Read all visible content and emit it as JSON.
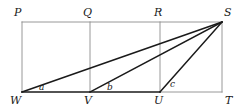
{
  "figure": {
    "kind": "geometry-diagram",
    "canvas": {
      "width": 250,
      "height": 111
    },
    "colors": {
      "stroke_thin": "#8c8c8c",
      "stroke_thick": "#1a1a1a",
      "label": "#1a1a1a",
      "background": "#ffffff"
    },
    "stroke_widths": {
      "thin": 0.9,
      "thick": 1.5
    },
    "points": {
      "P": {
        "x": 22,
        "y": 22
      },
      "Q": {
        "x": 90,
        "y": 22
      },
      "R": {
        "x": 160,
        "y": 22
      },
      "S": {
        "x": 222,
        "y": 22
      },
      "W": {
        "x": 22,
        "y": 92
      },
      "V": {
        "x": 90,
        "y": 92
      },
      "U": {
        "x": 160,
        "y": 92
      },
      "T": {
        "x": 222,
        "y": 92
      }
    },
    "thin_segments": [
      {
        "name": "top-edge-PS",
        "from": "P",
        "to": "S"
      },
      {
        "name": "left-edge-PW",
        "from": "P",
        "to": "W"
      },
      {
        "name": "right-edge-ST",
        "from": "S",
        "to": "T"
      },
      {
        "name": "bottom-edge-UT",
        "from": "U",
        "to": "T"
      },
      {
        "name": "divider-QV",
        "from": "Q",
        "to": "V"
      },
      {
        "name": "divider-RU",
        "from": "R",
        "to": "U"
      }
    ],
    "thick_segments": [
      {
        "name": "base-WU",
        "from": "W",
        "to": "U"
      },
      {
        "name": "cevian-SW",
        "from": "S",
        "to": "W"
      },
      {
        "name": "cevian-SV",
        "from": "S",
        "to": "V"
      },
      {
        "name": "cevian-SU",
        "from": "S",
        "to": "U"
      }
    ],
    "vertex_labels": [
      {
        "id": "P",
        "text": "P",
        "x": 14,
        "y": 7
      },
      {
        "id": "Q",
        "text": "Q",
        "x": 83,
        "y": 7
      },
      {
        "id": "R",
        "text": "R",
        "x": 154,
        "y": 7
      },
      {
        "id": "S",
        "text": "S",
        "x": 224,
        "y": 7
      },
      {
        "id": "W",
        "text": "W",
        "x": 10,
        "y": 95
      },
      {
        "id": "V",
        "text": "V",
        "x": 84,
        "y": 95
      },
      {
        "id": "U",
        "text": "U",
        "x": 154,
        "y": 95
      },
      {
        "id": "T",
        "text": "T",
        "x": 225,
        "y": 95
      }
    ],
    "angle_labels": [
      {
        "id": "a",
        "text": "a",
        "at_vertex": "W",
        "x": 39,
        "y": 83
      },
      {
        "id": "b",
        "text": "b",
        "at_vertex": "V",
        "x": 107,
        "y": 83
      },
      {
        "id": "c",
        "text": "c",
        "at_vertex": "U",
        "x": 170,
        "y": 80
      }
    ]
  }
}
